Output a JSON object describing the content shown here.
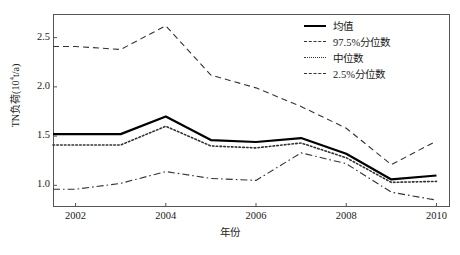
{
  "chart_data": {
    "type": "line",
    "title": "",
    "xlabel": "年份",
    "ylabel": "TN负荷(10⁴t/a)",
    "ylabel_base": "TN负荷(10",
    "ylabel_exp": "4",
    "ylabel_tail": "t/a)",
    "xlim": [
      2001.5,
      2010.3
    ],
    "ylim": [
      0.78,
      2.74
    ],
    "xticks": [
      2002,
      2004,
      2006,
      2008,
      2010
    ],
    "xticklabels": [
      "2002",
      "2004",
      "2006",
      "2008",
      "2010"
    ],
    "yticks": [
      1.0,
      1.5,
      2.0,
      2.5
    ],
    "yticklabels": [
      "1.0",
      "1.5",
      "2.0",
      "2.5"
    ],
    "grid": false,
    "legend_position": "upper right",
    "x": [
      2001.5,
      2002,
      2003,
      2004,
      2005,
      2006,
      2007,
      2008,
      2009,
      2010
    ],
    "series": [
      {
        "name": "均值",
        "style": "solid",
        "color": "#000000",
        "width": 2.2,
        "values": [
          1.52,
          1.52,
          1.52,
          1.7,
          1.46,
          1.44,
          1.48,
          1.32,
          1.06,
          1.1
        ]
      },
      {
        "name": "97.5%分位数",
        "style": "dashed",
        "color": "#333333",
        "width": 1.1,
        "values": [
          2.41,
          2.41,
          2.38,
          2.62,
          2.12,
          1.99,
          1.8,
          1.58,
          1.21,
          1.45
        ]
      },
      {
        "name": "中位数",
        "style": "dotted",
        "color": "#333333",
        "width": 1.6,
        "values": [
          1.41,
          1.41,
          1.41,
          1.6,
          1.4,
          1.38,
          1.43,
          1.28,
          1.03,
          1.04
        ]
      },
      {
        "name": "2.5%分位数",
        "style": "dashdot",
        "color": "#333333",
        "width": 1.1,
        "values": [
          0.96,
          0.96,
          1.02,
          1.14,
          1.07,
          1.05,
          1.33,
          1.22,
          0.93,
          0.85
        ]
      }
    ],
    "legend": [
      {
        "label": "均值",
        "style": "solid"
      },
      {
        "label": "97.5%分位数",
        "style": "dashed"
      },
      {
        "label": "中位数",
        "style": "dotted"
      },
      {
        "label": "2.5%分位数",
        "style": "dashdot"
      }
    ]
  }
}
